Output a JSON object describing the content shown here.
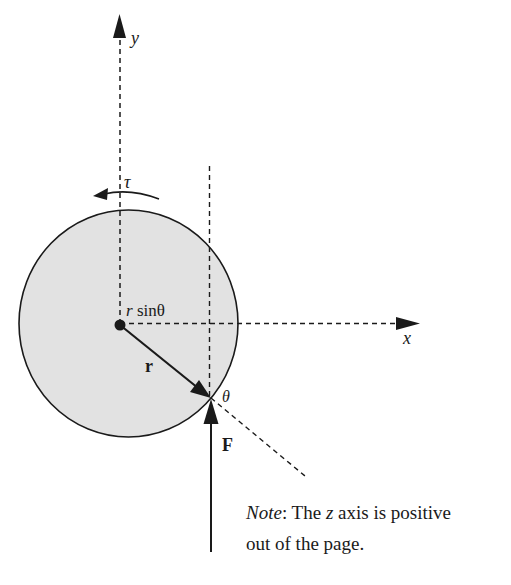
{
  "diagram": {
    "axes": {
      "y_label": "y",
      "x_label": "x"
    },
    "labels": {
      "torque": "τ",
      "moment_arm_r": "r",
      "moment_arm_sin": " sinθ",
      "position_vector": "r",
      "force": "F",
      "angle": "θ"
    },
    "note": {
      "prefix": "Note",
      "line1_rest_a": ": The ",
      "line1_z": "z",
      "line1_rest_b": " axis is positive",
      "line2": "out of the page."
    },
    "colors": {
      "disk_fill": "#e2e2e2",
      "stroke": "#1a1a1a",
      "background": "#ffffff"
    }
  }
}
